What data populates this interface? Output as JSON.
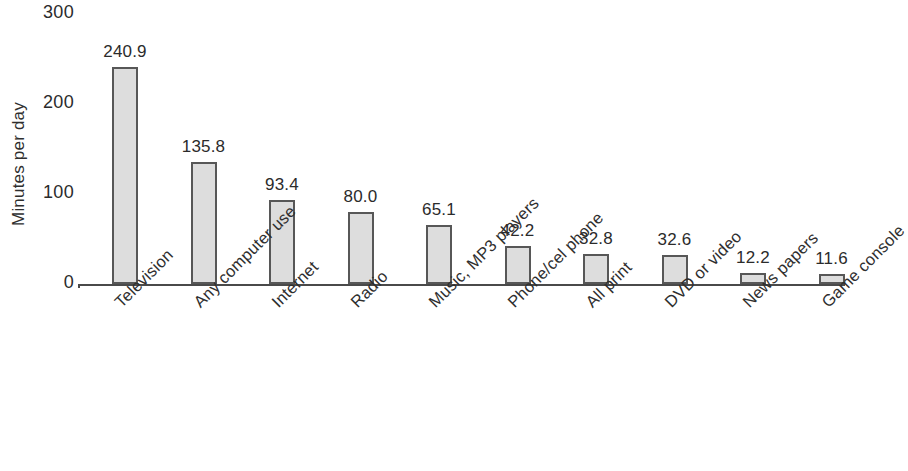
{
  "chart_data": {
    "type": "bar",
    "title": "",
    "subtitle": "",
    "xlabel": "",
    "ylabel": "Minutes per day",
    "ylim": [
      0,
      300
    ],
    "yticks": [
      0,
      100,
      200,
      300
    ],
    "ytick_labels": [
      "0",
      "100",
      "200",
      "300"
    ],
    "grid": false,
    "legend": null,
    "orientation": "vertical",
    "bar_fill_color": "#dddddd",
    "bar_edge_color": "#575757",
    "axis_color": "#4a4a4a",
    "categories": [
      "Television",
      "Any computer use",
      "Internet",
      "Radio",
      "Music, MP3 players",
      "Phone/cel phone",
      "All print",
      "DVD or video",
      "News papers",
      "Game console"
    ],
    "values": [
      240.9,
      135.8,
      93.4,
      80.0,
      65.1,
      42.2,
      32.8,
      32.6,
      12.2,
      11.6
    ],
    "value_labels": [
      "240.9",
      "135.8",
      "93.4",
      "80.0",
      "65.1",
      "42.2",
      "32.8",
      "32.6",
      "12.2",
      "11.6"
    ]
  }
}
